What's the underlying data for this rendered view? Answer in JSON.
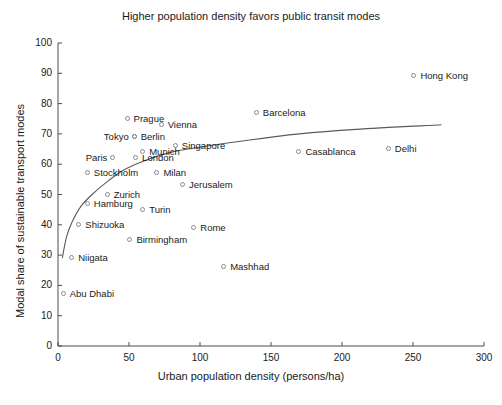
{
  "chart_data": {
    "type": "scatter",
    "title": "Higher population density favors public transit modes",
    "xlabel": "Urban population density (persons/ha)",
    "ylabel": "Modal share of sustainable transport modes",
    "xlim": [
      0,
      300
    ],
    "ylim": [
      0,
      100
    ],
    "xticks": [
      0,
      50,
      100,
      150,
      200,
      250,
      300
    ],
    "yticks": [
      0,
      10,
      20,
      30,
      40,
      50,
      60,
      70,
      80,
      90,
      100
    ],
    "grid": false,
    "legend": false,
    "marker": "open-circle",
    "marker_color": "#8a8a8a",
    "trend_color": "#5a5a5a",
    "points": [
      {
        "label": "Hong Kong",
        "x": 251,
        "y": 89,
        "label_pos": "right"
      },
      {
        "label": "Barcelona",
        "x": 140,
        "y": 77,
        "label_pos": "right"
      },
      {
        "label": "Prague",
        "x": 49,
        "y": 75,
        "label_pos": "right"
      },
      {
        "label": "Vienna",
        "x": 73,
        "y": 73,
        "label_pos": "right"
      },
      {
        "label": "Tokyo",
        "x": 54,
        "y": 69,
        "label_pos": "left"
      },
      {
        "label": "Berlin",
        "x": 54,
        "y": 69,
        "label_pos": "right"
      },
      {
        "label": "Singapore",
        "x": 83,
        "y": 66,
        "label_pos": "right"
      },
      {
        "label": "Casablanca",
        "x": 170,
        "y": 64,
        "label_pos": "right"
      },
      {
        "label": "Delhi",
        "x": 233,
        "y": 65,
        "label_pos": "right"
      },
      {
        "label": "Munich",
        "x": 60,
        "y": 64,
        "label_pos": "right"
      },
      {
        "label": "Paris",
        "x": 39,
        "y": 62,
        "label_pos": "left"
      },
      {
        "label": "London",
        "x": 55,
        "y": 62,
        "label_pos": "right"
      },
      {
        "label": "Stockholm",
        "x": 21,
        "y": 57,
        "label_pos": "right"
      },
      {
        "label": "Milan",
        "x": 70,
        "y": 57,
        "label_pos": "right"
      },
      {
        "label": "Jerusalem",
        "x": 88,
        "y": 53,
        "label_pos": "right"
      },
      {
        "label": "Zurich",
        "x": 35,
        "y": 50,
        "label_pos": "right"
      },
      {
        "label": "Hamburg",
        "x": 21,
        "y": 47,
        "label_pos": "right"
      },
      {
        "label": "Turin",
        "x": 60,
        "y": 45,
        "label_pos": "right"
      },
      {
        "label": "Shizuoka",
        "x": 15,
        "y": 40,
        "label_pos": "right"
      },
      {
        "label": "Rome",
        "x": 96,
        "y": 39,
        "label_pos": "right"
      },
      {
        "label": "Birmingham",
        "x": 51,
        "y": 35,
        "label_pos": "right"
      },
      {
        "label": "Niigata",
        "x": 10,
        "y": 29,
        "label_pos": "right"
      },
      {
        "label": "Mashhad",
        "x": 117,
        "y": 26,
        "label_pos": "right"
      },
      {
        "label": "Abu Dhabi",
        "x": 4,
        "y": 17,
        "label_pos": "right"
      }
    ],
    "trend_line": {
      "description": "logarithmic fit",
      "points": [
        {
          "x": 3,
          "y": 29
        },
        {
          "x": 6,
          "y": 36
        },
        {
          "x": 10,
          "y": 41
        },
        {
          "x": 16,
          "y": 46
        },
        {
          "x": 24,
          "y": 50
        },
        {
          "x": 34,
          "y": 54
        },
        {
          "x": 46,
          "y": 58
        },
        {
          "x": 60,
          "y": 61
        },
        {
          "x": 80,
          "y": 64
        },
        {
          "x": 105,
          "y": 66
        },
        {
          "x": 135,
          "y": 68
        },
        {
          "x": 170,
          "y": 70
        },
        {
          "x": 210,
          "y": 71.5
        },
        {
          "x": 270,
          "y": 73
        }
      ]
    }
  }
}
